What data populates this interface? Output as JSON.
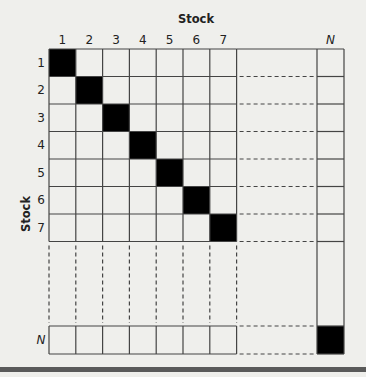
{
  "figure": {
    "column_axis_title": "Stock",
    "row_axis_title": "Stock",
    "column_labels": [
      "1",
      "2",
      "3",
      "4",
      "5",
      "6",
      "7"
    ],
    "row_labels": [
      "1",
      "2",
      "3",
      "4",
      "5",
      "6",
      "7"
    ],
    "last_label": "N",
    "filled_cells": "diagonal",
    "colors": {
      "background": "#efefec",
      "grid_line": "#444444",
      "filled_cell": "#000000",
      "bottom_bar": "#5a5a5a"
    }
  }
}
